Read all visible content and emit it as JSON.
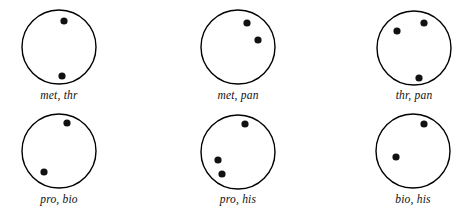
{
  "figure": {
    "background_color": "#ffffff",
    "stroke_color": "#000000",
    "dot_color": "#111111",
    "circle_stroke_width": 1.4,
    "dot_radius": 3.6,
    "circle_radius": 37,
    "panels": [
      {
        "id": "panel-met-thr",
        "label": "met, thr",
        "colony_count": 2,
        "center": {
          "x": 59,
          "y": 47
        },
        "colonies": [
          {
            "x": 64,
            "y": 21
          },
          {
            "x": 62,
            "y": 76
          }
        ]
      },
      {
        "id": "panel-met-pan",
        "label": "met, pan",
        "colony_count": 2,
        "center": {
          "x": 238,
          "y": 47
        },
        "colonies": [
          {
            "x": 247,
            "y": 23
          },
          {
            "x": 258,
            "y": 40
          }
        ]
      },
      {
        "id": "panel-thr-pan",
        "label": "thr, pan",
        "colony_count": 3,
        "center": {
          "x": 414,
          "y": 48
        },
        "colonies": [
          {
            "x": 397,
            "y": 31
          },
          {
            "x": 424,
            "y": 23
          },
          {
            "x": 419,
            "y": 78
          }
        ]
      },
      {
        "id": "panel-pro-bio",
        "label": "pro, bio",
        "colony_count": 2,
        "center": {
          "x": 59,
          "y": 151
        },
        "colonies": [
          {
            "x": 67,
            "y": 123
          },
          {
            "x": 44,
            "y": 172
          }
        ]
      },
      {
        "id": "panel-pro-his",
        "label": "pro, his",
        "colony_count": 3,
        "center": {
          "x": 238,
          "y": 152
        },
        "colonies": [
          {
            "x": 245,
            "y": 124
          },
          {
            "x": 218,
            "y": 160
          },
          {
            "x": 222,
            "y": 174
          }
        ]
      },
      {
        "id": "panel-bio-his",
        "label": "bio, his",
        "colony_count": 2,
        "center": {
          "x": 413,
          "y": 151
        },
        "colonies": [
          {
            "x": 424,
            "y": 124
          },
          {
            "x": 396,
            "y": 157
          }
        ]
      }
    ],
    "label_positions": [
      {
        "x": 59,
        "y": 96
      },
      {
        "x": 238,
        "y": 96
      },
      {
        "x": 414,
        "y": 96
      },
      {
        "x": 59,
        "y": 200
      },
      {
        "x": 238,
        "y": 200
      },
      {
        "x": 413,
        "y": 200
      }
    ]
  }
}
